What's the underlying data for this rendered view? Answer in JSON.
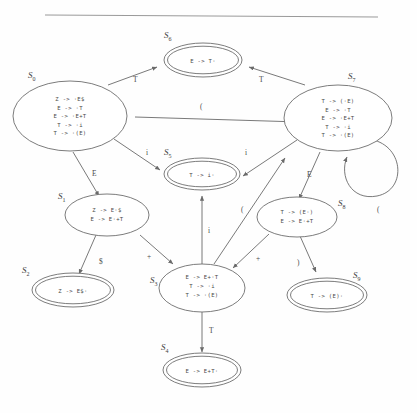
{
  "figure": {
    "kind": "lr-item-set-automaton",
    "divider": "horizontal-rule"
  },
  "colors": {
    "background": "#fefefe",
    "stroke": "#6d6d6d",
    "text": "#4a4a4a",
    "divider": "#9a9a9a"
  },
  "states": [
    {
      "id": "S0",
      "label": "S",
      "subscript": "0",
      "accepting": false,
      "productions": [
        {
          "lhs": "Z",
          "arrow": "->",
          "rhs": "·E$",
          "text": "Z  ->  ·E$"
        },
        {
          "lhs": "E",
          "arrow": "->",
          "rhs": "·T",
          "text": "E  ->  ·T"
        },
        {
          "lhs": "E",
          "arrow": "->",
          "rhs": "·E+T",
          "text": "E  ->  ·E+T"
        },
        {
          "lhs": "T",
          "arrow": "->",
          "rhs": "·i",
          "text": "T  ->  ·i"
        },
        {
          "lhs": "T",
          "arrow": "->",
          "rhs": "·(E)",
          "text": "T  ->  ·(E)"
        }
      ]
    },
    {
      "id": "S1",
      "label": "S",
      "subscript": "1",
      "accepting": false,
      "productions": [
        {
          "lhs": "Z",
          "arrow": "->",
          "rhs": "E·$",
          "text": "Z  ->  E·$"
        },
        {
          "lhs": "E",
          "arrow": "->",
          "rhs": "E·+T",
          "text": "E  ->  E·+T"
        }
      ]
    },
    {
      "id": "S2",
      "label": "S",
      "subscript": "2",
      "accepting": true,
      "productions": [
        {
          "lhs": "Z",
          "arrow": "->",
          "rhs": "E$·",
          "text": "Z  ->  E$·"
        }
      ]
    },
    {
      "id": "S3",
      "label": "S",
      "subscript": "3",
      "accepting": false,
      "productions": [
        {
          "lhs": "E",
          "arrow": "->",
          "rhs": "E+·T",
          "text": "E  ->  E+·T"
        },
        {
          "lhs": "T",
          "arrow": "->",
          "rhs": "·i",
          "text": "T  ->  ·i"
        },
        {
          "lhs": "T",
          "arrow": "->",
          "rhs": "·(E)",
          "text": "T  ->  ·(E)"
        }
      ]
    },
    {
      "id": "S4",
      "label": "S",
      "subscript": "4",
      "accepting": true,
      "productions": [
        {
          "lhs": "E",
          "arrow": "->",
          "rhs": "E+T·",
          "text": "E  ->  E+T·"
        }
      ]
    },
    {
      "id": "S5",
      "label": "S",
      "subscript": "5",
      "accepting": true,
      "productions": [
        {
          "lhs": "T",
          "arrow": "->",
          "rhs": "i·",
          "text": "T  ->  i·"
        }
      ]
    },
    {
      "id": "S6",
      "label": "S",
      "subscript": "6",
      "accepting": true,
      "productions": [
        {
          "lhs": "E",
          "arrow": "->",
          "rhs": "T·",
          "text": "E  ->  T·"
        }
      ]
    },
    {
      "id": "S7",
      "label": "S",
      "subscript": "7",
      "accepting": false,
      "productions": [
        {
          "lhs": "T",
          "arrow": "->",
          "rhs": "(·E)",
          "text": "T  ->  (·E)"
        },
        {
          "lhs": "E",
          "arrow": "->",
          "rhs": "·T",
          "text": "E  ->  ·T"
        },
        {
          "lhs": "E",
          "arrow": "->",
          "rhs": "·E+T",
          "text": "E  ->  ·E+T"
        },
        {
          "lhs": "T",
          "arrow": "->",
          "rhs": "·i",
          "text": "T  ->  ·i"
        },
        {
          "lhs": "T",
          "arrow": "->",
          "rhs": "·(E)",
          "text": "T  ->  ·(E)"
        }
      ]
    },
    {
      "id": "S8",
      "label": "S",
      "subscript": "8",
      "accepting": false,
      "productions": [
        {
          "lhs": "T",
          "arrow": "->",
          "rhs": "(E·)",
          "text": "T  ->  (E·)"
        },
        {
          "lhs": "E",
          "arrow": "->",
          "rhs": "E·+T",
          "text": "E  ->  E·+T"
        }
      ]
    },
    {
      "id": "S9",
      "label": "S",
      "subscript": "9",
      "accepting": true,
      "productions": [
        {
          "lhs": "T",
          "arrow": "->",
          "rhs": "(E)·",
          "text": "T  ->  (E)·"
        }
      ]
    }
  ],
  "transitions": [
    {
      "from": "S0",
      "to": "S6",
      "label": "T"
    },
    {
      "from": "S0",
      "to": "S7",
      "label": "("
    },
    {
      "from": "S0",
      "to": "S5",
      "label": "i"
    },
    {
      "from": "S0",
      "to": "S1",
      "label": "E"
    },
    {
      "from": "S1",
      "to": "S2",
      "label": "$"
    },
    {
      "from": "S1",
      "to": "S3",
      "label": "+"
    },
    {
      "from": "S3",
      "to": "S5",
      "label": "i"
    },
    {
      "from": "S3",
      "to": "S4",
      "label": "T"
    },
    {
      "from": "S3",
      "to": "S7",
      "label": "("
    },
    {
      "from": "S7",
      "to": "S6",
      "label": "T"
    },
    {
      "from": "S7",
      "to": "S5",
      "label": "i"
    },
    {
      "from": "S7",
      "to": "S8",
      "label": "E"
    },
    {
      "from": "S7",
      "to": "S7",
      "label": "("
    },
    {
      "from": "S8",
      "to": "S9",
      "label": ")"
    },
    {
      "from": "S8",
      "to": "S3",
      "label": "+"
    }
  ]
}
